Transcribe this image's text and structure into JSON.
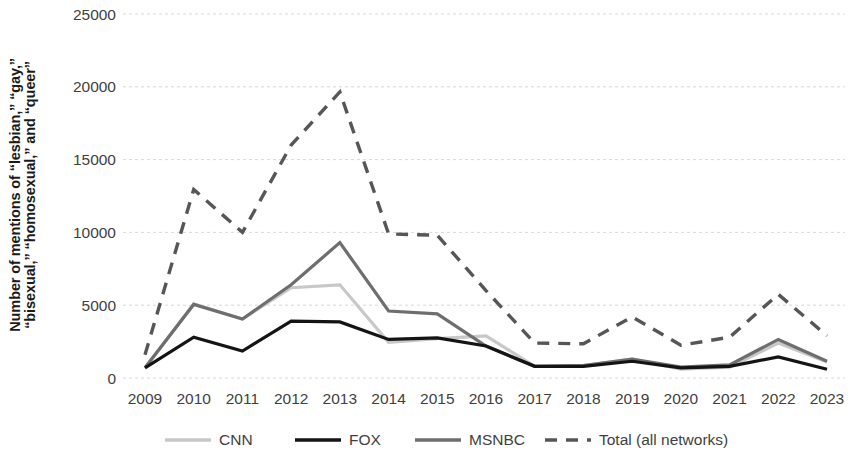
{
  "axis": {
    "ylabel_line1": "Number of mentions of “lesbian,” “gay,”",
    "ylabel_line2": "“bisexual,” “homosexual,” and “queer”",
    "yticks": [
      "0",
      "5000",
      "10000",
      "15000",
      "20000",
      "25000"
    ],
    "xticks": [
      "2009",
      "2010",
      "2011",
      "2012",
      "2013",
      "2014",
      "2015",
      "2016",
      "2017",
      "2018",
      "2019",
      "2020",
      "2021",
      "2022",
      "2023"
    ]
  },
  "colors": {
    "cnn": "#c8c8c8",
    "fox": "#141414",
    "msnbc": "#6e6e6e",
    "total": "#565656",
    "grid": "#d9d9d9",
    "axis_text": "#3f3f3f",
    "label_text": "#1a1a1a"
  },
  "legend": [
    {
      "label": "CNN",
      "key": "cnn",
      "color": "#c8c8c8",
      "dash": "none"
    },
    {
      "label": "FOX",
      "key": "fox",
      "color": "#141414",
      "dash": "none"
    },
    {
      "label": "MSNBC",
      "key": "msnbc",
      "color": "#6e6e6e",
      "dash": "none"
    },
    {
      "label": "Total (all networks)",
      "key": "total",
      "color": "#565656",
      "dash": "dashed"
    }
  ],
  "chart_data": {
    "type": "line",
    "title": "",
    "xlabel": "",
    "ylabel": "Number of mentions of “lesbian,” “gay,” “bisexual,” “homosexual,” and “queer”",
    "categories": [
      "2009",
      "2010",
      "2011",
      "2012",
      "2013",
      "2014",
      "2015",
      "2016",
      "2017",
      "2018",
      "2019",
      "2020",
      "2021",
      "2022",
      "2023"
    ],
    "ylim": [
      0,
      25000
    ],
    "yticks": [
      0,
      5000,
      10000,
      15000,
      20000,
      25000
    ],
    "grid": "horizontal",
    "legend_position": "bottom",
    "series": [
      {
        "name": "CNN",
        "color": "#c8c8c8",
        "style": "solid",
        "values": [
          700,
          5100,
          4050,
          6200,
          6400,
          2450,
          2700,
          2900,
          800,
          850,
          1300,
          600,
          750,
          2400,
          1100
        ]
      },
      {
        "name": "FOX",
        "color": "#141414",
        "style": "solid",
        "values": [
          700,
          2800,
          1850,
          3900,
          3850,
          2650,
          2750,
          2200,
          800,
          800,
          1150,
          700,
          800,
          1450,
          600
        ]
      },
      {
        "name": "MSNBC",
        "color": "#6e6e6e",
        "style": "solid",
        "values": [
          700,
          5050,
          4050,
          6400,
          9300,
          4600,
          4400,
          2200,
          800,
          850,
          1300,
          750,
          900,
          2650,
          1150
        ]
      },
      {
        "name": "Total (all networks)",
        "color": "#565656",
        "style": "dashed",
        "values": [
          1600,
          12950,
          10000,
          16000,
          19650,
          9900,
          9800,
          6000,
          2400,
          2350,
          4200,
          2250,
          2800,
          5750,
          2900
        ]
      }
    ]
  }
}
